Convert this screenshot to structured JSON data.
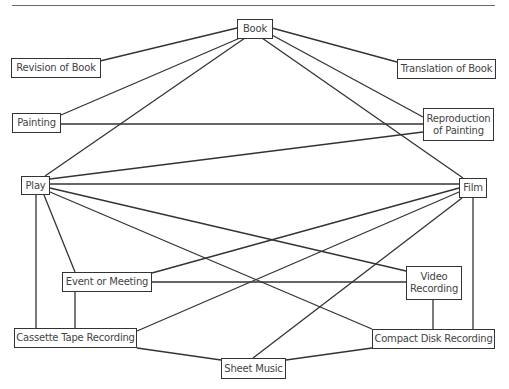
{
  "diagram": {
    "nodes": [
      {
        "id": "book",
        "label": "Book",
        "x": 237,
        "y": 19,
        "w": 36,
        "h": 20
      },
      {
        "id": "revision",
        "label": "Revision of Book",
        "x": 11,
        "y": 58,
        "w": 90,
        "h": 20
      },
      {
        "id": "translation",
        "label": "Translation of Book",
        "x": 397,
        "y": 59,
        "w": 99,
        "h": 20
      },
      {
        "id": "painting",
        "label": "Painting",
        "x": 12,
        "y": 113,
        "w": 49,
        "h": 20
      },
      {
        "id": "reproduction",
        "label": "Reproduction\nof Painting",
        "x": 423,
        "y": 108,
        "w": 71,
        "h": 33
      },
      {
        "id": "play",
        "label": "Play",
        "x": 21,
        "y": 176,
        "w": 29,
        "h": 19
      },
      {
        "id": "film",
        "label": "Film",
        "x": 459,
        "y": 178,
        "w": 28,
        "h": 20
      },
      {
        "id": "event",
        "label": "Event or Meeting",
        "x": 62,
        "y": 272,
        "w": 90,
        "h": 20
      },
      {
        "id": "video",
        "label": "Video\nRecording",
        "x": 406,
        "y": 266,
        "w": 56,
        "h": 34
      },
      {
        "id": "cassette",
        "label": "Cassette Tape Recording",
        "x": 14,
        "y": 328,
        "w": 123,
        "h": 20
      },
      {
        "id": "cd",
        "label": "Compact Disk Recording",
        "x": 372,
        "y": 329,
        "w": 123,
        "h": 20
      },
      {
        "id": "sheet",
        "label": "Sheet Music",
        "x": 221,
        "y": 358,
        "w": 65,
        "h": 21
      }
    ],
    "edges": [
      {
        "from": "book",
        "to": "revision",
        "x1": 237,
        "y1": 28,
        "x2": 100,
        "y2": 61
      },
      {
        "from": "book",
        "to": "translation",
        "x1": 272,
        "y1": 28,
        "x2": 397,
        "y2": 62
      },
      {
        "from": "book",
        "to": "painting",
        "x1": 240,
        "y1": 38,
        "x2": 61,
        "y2": 115
      },
      {
        "from": "book",
        "to": "play",
        "x1": 245,
        "y1": 38,
        "x2": 45,
        "y2": 176
      },
      {
        "from": "book",
        "to": "film",
        "x1": 262,
        "y1": 38,
        "x2": 463,
        "y2": 178
      },
      {
        "from": "book",
        "to": "reproduction",
        "x1": 270,
        "y1": 34,
        "x2": 423,
        "y2": 117
      },
      {
        "from": "painting",
        "to": "reproduction",
        "x1": 61,
        "y1": 124,
        "x2": 423,
        "y2": 124
      },
      {
        "from": "play",
        "to": "reproduction",
        "x1": 50,
        "y1": 179,
        "x2": 423,
        "y2": 132
      },
      {
        "from": "play",
        "to": "film",
        "x1": 50,
        "y1": 184,
        "x2": 459,
        "y2": 184
      },
      {
        "from": "play",
        "to": "video",
        "x1": 50,
        "y1": 188,
        "x2": 406,
        "y2": 271
      },
      {
        "from": "play",
        "to": "cd",
        "x1": 50,
        "y1": 192,
        "x2": 372,
        "y2": 329
      },
      {
        "from": "play",
        "to": "event",
        "x1": 44,
        "y1": 195,
        "x2": 75,
        "y2": 272
      },
      {
        "from": "play",
        "to": "cassette",
        "x1": 36,
        "y1": 195,
        "x2": 36,
        "y2": 328
      },
      {
        "from": "film",
        "to": "event",
        "x1": 459,
        "y1": 188,
        "x2": 152,
        "y2": 273
      },
      {
        "from": "film",
        "to": "cassette",
        "x1": 459,
        "y1": 192,
        "x2": 137,
        "y2": 331
      },
      {
        "from": "film",
        "to": "sheet",
        "x1": 462,
        "y1": 198,
        "x2": 253,
        "y2": 358
      },
      {
        "from": "film",
        "to": "cd",
        "x1": 473,
        "y1": 198,
        "x2": 473,
        "y2": 329
      },
      {
        "from": "event",
        "to": "video",
        "x1": 152,
        "y1": 282,
        "x2": 406,
        "y2": 282
      },
      {
        "from": "event",
        "to": "cassette",
        "x1": 75,
        "y1": 292,
        "x2": 75,
        "y2": 328
      },
      {
        "from": "video",
        "to": "cd",
        "x1": 433,
        "y1": 300,
        "x2": 433,
        "y2": 329
      },
      {
        "from": "cassette",
        "to": "sheet",
        "x1": 137,
        "y1": 348,
        "x2": 221,
        "y2": 360
      },
      {
        "from": "cd",
        "to": "sheet",
        "x1": 372,
        "y1": 348,
        "x2": 286,
        "y2": 360
      }
    ]
  }
}
